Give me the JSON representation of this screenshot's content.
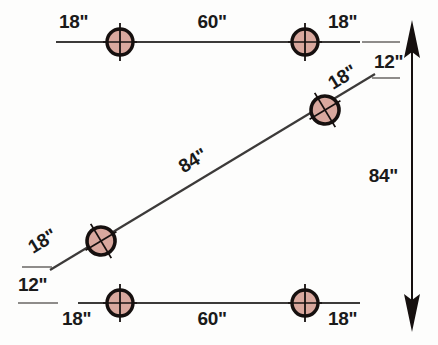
{
  "diagram": {
    "colors": {
      "hole_fill": "#d9a89e",
      "hole_ring": "#16100f",
      "center_line": "#3c3a39",
      "extension_line": "#8e8c8a",
      "text": "#1a1a1a",
      "background": "#fdfdfc"
    },
    "labels": {
      "top_left_edge": "18\"",
      "top_span": "60\"",
      "top_right_edge": "18\"",
      "upper_right_offset": "12\"",
      "diagonal_upper_edge": "18\"",
      "diagonal_span": "84\"",
      "diagonal_lower_edge": "18\"",
      "lower_left_offset": "12\"",
      "bottom_left_edge": "18\"",
      "bottom_span": "60\"",
      "bottom_right_edge": "18\"",
      "vertical_overall": "84\""
    },
    "holes": [
      {
        "id": "top-left-hole",
        "cx": 120,
        "cy": 42,
        "r": 13,
        "rotation": 0
      },
      {
        "id": "top-right-hole",
        "cx": 305,
        "cy": 42,
        "r": 13,
        "rotation": 0
      },
      {
        "id": "diagonal-upper-hole",
        "cx": 325,
        "cy": 110,
        "r": 14,
        "rotation": 34
      },
      {
        "id": "diagonal-lower-hole",
        "cx": 101,
        "cy": 241,
        "r": 14,
        "rotation": 34
      },
      {
        "id": "bottom-left-hole",
        "cx": 120,
        "cy": 303,
        "r": 13,
        "rotation": 0
      },
      {
        "id": "bottom-right-hole",
        "cx": 305,
        "cy": 303,
        "r": 13,
        "rotation": 0
      }
    ],
    "lines": {
      "top_centerline": {
        "x1": 56,
        "y1": 42,
        "x2": 360,
        "y2": 42
      },
      "bottom_centerline": {
        "x1": 78,
        "y1": 303,
        "x2": 360,
        "y2": 303
      },
      "diagonal_centerline": {
        "x1": 50,
        "y1": 270,
        "x2": 375,
        "y2": 74
      }
    },
    "dimension_arrow": {
      "x": 412,
      "y_top": 46,
      "y_bottom": 306,
      "value": "84\"",
      "double_headed": true
    }
  }
}
